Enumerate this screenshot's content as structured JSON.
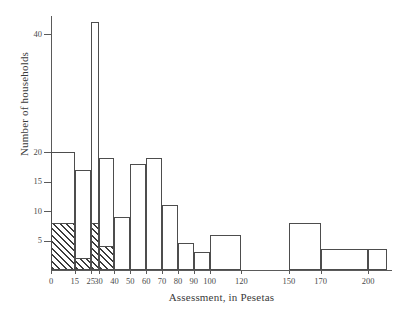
{
  "chart_data": {
    "type": "bar",
    "title": "",
    "subtitle": "",
    "xlabel": "Assessment,  in Pesetas",
    "ylabel": "Number of households",
    "grid": false,
    "legend": null,
    "xlim": [
      0,
      215
    ],
    "ylim": [
      0,
      43
    ],
    "xtick_labels": [
      "0",
      "15",
      "25",
      "30",
      "40",
      "50",
      "60",
      "70",
      "80",
      "90",
      "100",
      "120",
      "150",
      "170",
      "200"
    ],
    "xtick_values": [
      0,
      15,
      25,
      30,
      40,
      50,
      60,
      70,
      80,
      90,
      100,
      120,
      150,
      170,
      200
    ],
    "ytick_labels": [
      "5",
      "10",
      "15",
      "20",
      "40"
    ],
    "ytick_values": [
      5,
      10,
      15,
      20,
      40
    ],
    "bins": [
      {
        "start": 0,
        "end": 15,
        "value": 20,
        "hatched_value": 8
      },
      {
        "start": 15,
        "end": 25,
        "value": 17,
        "hatched_value": 2
      },
      {
        "start": 25,
        "end": 30,
        "value": 42,
        "hatched_value": 8
      },
      {
        "start": 30,
        "end": 40,
        "value": 19,
        "hatched_value": 4
      },
      {
        "start": 40,
        "end": 50,
        "value": 9,
        "hatched_value": 0
      },
      {
        "start": 50,
        "end": 60,
        "value": 18,
        "hatched_value": 0
      },
      {
        "start": 60,
        "end": 70,
        "value": 19,
        "hatched_value": 0
      },
      {
        "start": 70,
        "end": 80,
        "value": 11,
        "hatched_value": 0
      },
      {
        "start": 80,
        "end": 90,
        "value": 4.5,
        "hatched_value": 0
      },
      {
        "start": 90,
        "end": 100,
        "value": 3,
        "hatched_value": 0
      },
      {
        "start": 100,
        "end": 120,
        "value": 6,
        "hatched_value": 0
      },
      {
        "start": 150,
        "end": 170,
        "value": 8,
        "hatched_value": 0
      },
      {
        "start": 170,
        "end": 200,
        "value": 3.5,
        "hatched_value": 0
      },
      {
        "start": 200,
        "end": 212,
        "value": 3.5,
        "hatched_value": 0
      }
    ],
    "colors": {
      "bar_fill": "#ffffff",
      "bar_stroke": "#4d4d4d",
      "hatch_stroke": "#3c3c3c",
      "axis": "#5a5a5a",
      "text": "#3a3a3a",
      "background": "#ffffff"
    }
  }
}
